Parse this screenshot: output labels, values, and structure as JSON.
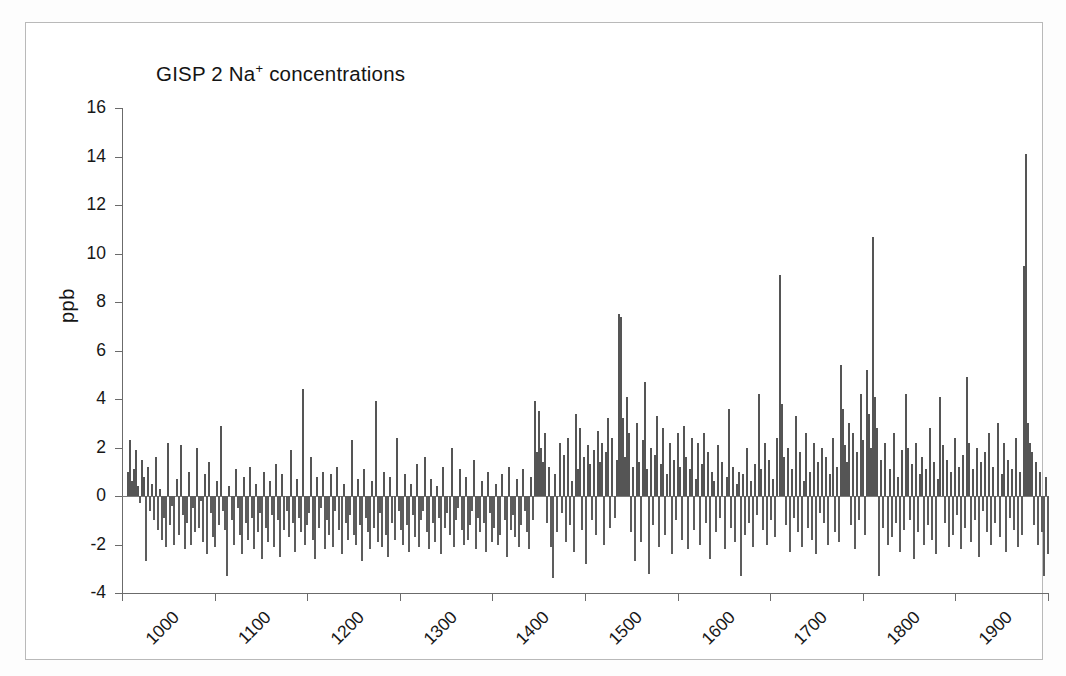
{
  "figure": {
    "background": "#ffffff",
    "frame_color": "#b9b9b9",
    "bar_color": "#555555",
    "axis_color": "#6b6b6b"
  },
  "chart_data": {
    "type": "bar",
    "title_main": "GISP 2 Na",
    "title_sup": "+",
    "title_tail": "concentrations",
    "xlabel": "",
    "ylabel": "ppb",
    "xlim": [
      1000,
      2000
    ],
    "ylim": [
      -4,
      16
    ],
    "grid": false,
    "legend": null,
    "baseline": 0,
    "xticks": [
      1000,
      1100,
      1200,
      1300,
      1400,
      1500,
      1600,
      1700,
      1800,
      1900,
      2000
    ],
    "xtick_labels": [
      "1000",
      "1100",
      "1200",
      "1300",
      "1400",
      "1500",
      "1600",
      "1700",
      "1800",
      "1900",
      "2000"
    ],
    "yticks": [
      -4,
      -2,
      0,
      2,
      4,
      6,
      8,
      10,
      12,
      14,
      16
    ],
    "ytick_labels": [
      "-4",
      "-2",
      "0",
      "2",
      "4",
      "6",
      "8",
      "10",
      "12",
      "14",
      "16"
    ],
    "x_start": 1005,
    "x_step": 2.2,
    "values": [
      1.0,
      2.3,
      0.6,
      1.1,
      1.9,
      0.4,
      -0.3,
      1.5,
      0.8,
      -2.7,
      1.2,
      -0.6,
      0.5,
      -1.0,
      1.6,
      -1.4,
      0.3,
      -1.8,
      -0.9,
      -2.1,
      2.2,
      -1.2,
      -0.4,
      -2.0,
      0.7,
      -1.6,
      2.1,
      -0.8,
      -2.2,
      -1.1,
      1.0,
      -2.0,
      -0.5,
      -1.5,
      2.0,
      -1.3,
      -0.2,
      -1.9,
      0.9,
      -2.4,
      1.4,
      -0.7,
      -1.7,
      -2.1,
      0.6,
      -1.2,
      2.9,
      -0.6,
      -1.4,
      -3.3,
      0.4,
      -1.0,
      -2.0,
      1.1,
      -0.5,
      -1.6,
      -2.4,
      0.8,
      -1.1,
      -1.8,
      1.2,
      -0.9,
      -2.2,
      0.5,
      -1.5,
      -0.7,
      -2.6,
      1.0,
      -1.3,
      -1.9,
      0.6,
      -0.8,
      -2.1,
      1.3,
      -1.0,
      -2.5,
      0.9,
      -1.4,
      -0.6,
      -1.7,
      1.9,
      -1.1,
      -2.3,
      0.7,
      -0.9,
      -1.5,
      4.4,
      -2.0,
      -1.2,
      -0.7,
      1.6,
      -1.8,
      -2.6,
      0.8,
      -1.3,
      -0.5,
      1.0,
      -2.2,
      -1.0,
      -1.6,
      0.9,
      -2.1,
      -0.6,
      1.2,
      -1.4,
      -2.4,
      0.5,
      -1.1,
      -1.8,
      -0.8,
      2.3,
      -1.6,
      -2.0,
      0.7,
      -1.2,
      -2.7,
      1.1,
      -0.9,
      -1.5,
      -2.2,
      0.6,
      -1.3,
      3.9,
      -1.9,
      -0.7,
      -2.1,
      1.0,
      -1.6,
      -2.5,
      0.8,
      -1.1,
      -1.8,
      2.4,
      -0.6,
      -1.4,
      -2.0,
      0.9,
      -1.2,
      -2.3,
      0.5,
      -0.8,
      -1.7,
      1.3,
      -2.1,
      -1.0,
      -0.6,
      1.6,
      -1.5,
      -2.2,
      0.7,
      -1.1,
      -1.9,
      0.4,
      -0.9,
      -2.4,
      1.2,
      -1.3,
      -0.7,
      -1.6,
      2.0,
      -2.1,
      -1.0,
      -0.5,
      1.1,
      -1.4,
      -2.0,
      0.8,
      -1.8,
      -1.2,
      -0.6,
      1.5,
      -2.2,
      -0.9,
      -1.5,
      0.6,
      -1.1,
      -2.3,
      1.0,
      -0.7,
      -1.9,
      -1.3,
      0.5,
      -2.0,
      -1.6,
      0.9,
      -1.0,
      -2.5,
      1.2,
      -1.4,
      -0.8,
      -1.7,
      0.7,
      -2.1,
      -1.2,
      1.1,
      -0.6,
      -1.5,
      -2.2,
      0.8,
      -1.0,
      3.9,
      1.8,
      3.5,
      2.0,
      1.4,
      2.6,
      -1.1,
      1.2,
      -2.1,
      -3.4,
      0.9,
      -1.5,
      2.2,
      -0.7,
      1.7,
      -1.9,
      2.4,
      -1.2,
      0.6,
      -2.3,
      3.4,
      1.1,
      2.8,
      -1.4,
      1.6,
      -2.8,
      2.1,
      1.3,
      -1.0,
      1.9,
      -1.6,
      2.7,
      1.4,
      2.2,
      -2.0,
      1.8,
      3.2,
      -1.3,
      2.4,
      -0.9,
      1.5,
      7.5,
      7.4,
      3.2,
      1.6,
      4.1,
      2.6,
      -1.5,
      1.2,
      -2.7,
      3.0,
      1.4,
      -1.9,
      2.3,
      4.7,
      1.1,
      -3.2,
      2.0,
      -1.2,
      1.7,
      3.3,
      -2.1,
      1.3,
      2.8,
      -1.6,
      0.9,
      2.2,
      -2.4,
      1.5,
      -1.0,
      2.6,
      1.2,
      -1.8,
      2.9,
      1.6,
      -2.2,
      1.1,
      2.4,
      -1.4,
      0.7,
      2.2,
      -2.0,
      1.3,
      2.6,
      -1.1,
      1.8,
      -2.6,
      1.0,
      0.6,
      -1.5,
      2.1,
      -0.9,
      1.4,
      -2.2,
      0.8,
      3.6,
      -1.3,
      1.2,
      -1.9,
      0.5,
      1.0,
      -3.3,
      0.9,
      -1.6,
      2.0,
      -1.1,
      0.6,
      -2.1,
      1.3,
      -0.8,
      4.2,
      1.1,
      -1.4,
      2.2,
      -2.0,
      1.5,
      -1.0,
      0.7,
      -1.7,
      2.4,
      9.1,
      3.8,
      1.6,
      -1.2,
      2.0,
      -2.3,
      1.1,
      -0.9,
      3.3,
      -1.5,
      1.8,
      -2.1,
      0.6,
      2.6,
      -1.3,
      1.0,
      -1.8,
      2.2,
      -2.4,
      1.4,
      -0.7,
      2.0,
      -1.1,
      1.6,
      -2.0,
      0.9,
      2.4,
      -1.5,
      1.2,
      -1.9,
      5.4,
      3.6,
      2.1,
      1.4,
      3.0,
      -1.2,
      2.6,
      -2.2,
      1.8,
      -1.0,
      4.2,
      2.3,
      -1.6,
      5.2,
      3.4,
      2.0,
      10.7,
      4.1,
      2.8,
      -3.3,
      1.5,
      -1.3,
      2.2,
      -2.0,
      1.1,
      -1.7,
      2.6,
      -1.1,
      0.8,
      -2.3,
      1.9,
      -1.4,
      4.2,
      2.0,
      -1.0,
      1.3,
      -2.6,
      2.2,
      -1.5,
      0.9,
      1.6,
      -2.0,
      1.1,
      -1.2,
      2.8,
      -1.8,
      1.4,
      -2.4,
      0.7,
      4.1,
      2.1,
      -1.1,
      1.5,
      -2.1,
      1.0,
      -1.6,
      2.4,
      -0.8,
      1.2,
      -2.2,
      1.7,
      -1.3,
      4.9,
      2.2,
      -1.9,
      1.1,
      -1.0,
      2.0,
      -2.5,
      1.4,
      -0.6,
      1.8,
      -1.5,
      2.6,
      -2.0,
      1.2,
      -1.1,
      3.0,
      -1.7,
      0.9,
      2.2,
      -2.3,
      1.5,
      -0.9,
      1.1,
      -1.4,
      2.4,
      -2.1,
      1.0,
      -1.6,
      9.5,
      14.1,
      3.0,
      2.2,
      1.8,
      -1.2,
      1.4,
      -2.0,
      1.0,
      -1.5,
      -3.3,
      0.8,
      -2.4,
      1.2,
      -1.0,
      2.6,
      -1.8,
      1.1,
      -1.3,
      0.6,
      1.5,
      -2.1,
      1.0,
      -1.6,
      1.3,
      -0.9,
      -2.2,
      0.7,
      -1.4,
      -2.0,
      1.0,
      -0.6,
      -1.1
    ]
  }
}
